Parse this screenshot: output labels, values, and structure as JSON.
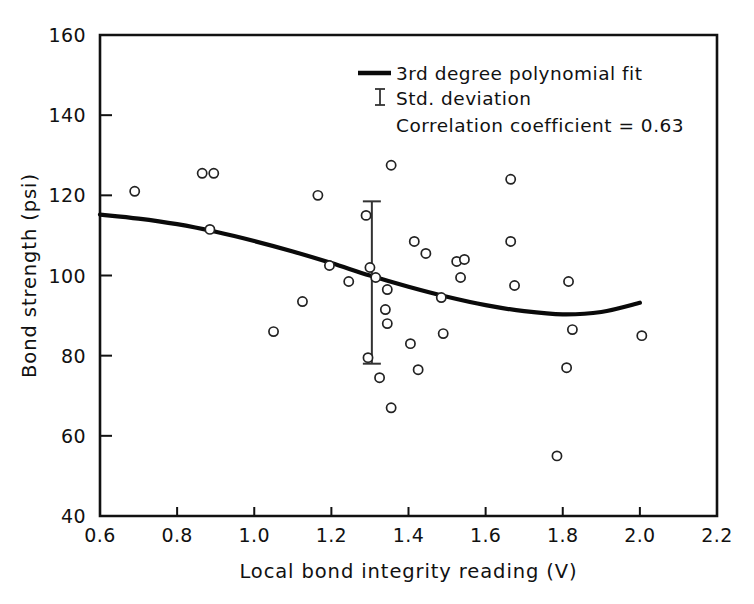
{
  "chart_data": {
    "type": "scatter",
    "title": "",
    "xlabel": "Local bond integrity reading (V)",
    "ylabel": "Bond strength (psi)",
    "xlim": [
      0.6,
      2.2
    ],
    "ylim": [
      40,
      160
    ],
    "xticks": [
      "0.6",
      "0.8",
      "1.0",
      "1.2",
      "1.4",
      "1.6",
      "1.8",
      "2.0",
      "2.2"
    ],
    "xtick_values": [
      0.6,
      0.8,
      1.0,
      1.2,
      1.4,
      1.6,
      1.8,
      2.0,
      2.2
    ],
    "yticks": [
      "40",
      "60",
      "80",
      "100",
      "120",
      "140",
      "160"
    ],
    "ytick_values": [
      40,
      60,
      80,
      100,
      120,
      140,
      160
    ],
    "grid": false,
    "legend_position": "upper-right",
    "points": [
      [
        0.69,
        121.0
      ],
      [
        0.865,
        125.5
      ],
      [
        0.895,
        125.5
      ],
      [
        0.885,
        111.5
      ],
      [
        1.05,
        86.0
      ],
      [
        1.125,
        93.5
      ],
      [
        1.165,
        120.0
      ],
      [
        1.195,
        102.5
      ],
      [
        1.245,
        98.5
      ],
      [
        1.29,
        115.0
      ],
      [
        1.3,
        102.0
      ],
      [
        1.315,
        99.5
      ],
      [
        1.295,
        79.5
      ],
      [
        1.325,
        74.5
      ],
      [
        1.355,
        127.5
      ],
      [
        1.345,
        96.5
      ],
      [
        1.34,
        91.5
      ],
      [
        1.345,
        88.0
      ],
      [
        1.355,
        67.0
      ],
      [
        1.405,
        83.0
      ],
      [
        1.415,
        108.5
      ],
      [
        1.445,
        105.5
      ],
      [
        1.425,
        76.5
      ],
      [
        1.485,
        94.5
      ],
      [
        1.49,
        85.5
      ],
      [
        1.525,
        103.5
      ],
      [
        1.545,
        104.0
      ],
      [
        1.535,
        99.5
      ],
      [
        1.665,
        124.0
      ],
      [
        1.665,
        108.5
      ],
      [
        1.675,
        97.5
      ],
      [
        1.785,
        55.0
      ],
      [
        1.815,
        98.5
      ],
      [
        1.825,
        86.5
      ],
      [
        1.81,
        77.0
      ],
      [
        2.005,
        85.0
      ]
    ],
    "fit_curve": {
      "label": "3rd degree polynomial fit",
      "x_range": [
        0.6,
        2.0
      ],
      "points": [
        [
          0.6,
          115.2
        ],
        [
          0.7,
          114.2
        ],
        [
          0.8,
          112.8
        ],
        [
          0.9,
          110.9
        ],
        [
          1.0,
          108.6
        ],
        [
          1.1,
          106.0
        ],
        [
          1.2,
          103.1
        ],
        [
          1.3,
          100.0
        ],
        [
          1.4,
          97.2
        ],
        [
          1.5,
          94.7
        ],
        [
          1.6,
          92.6
        ],
        [
          1.7,
          91.1
        ],
        [
          1.8,
          90.3
        ],
        [
          1.9,
          90.9
        ],
        [
          2.0,
          93.2
        ]
      ]
    },
    "error_bar": {
      "label": "Std. deviation",
      "x": 1.305,
      "center": 100.0,
      "upper": 118.5,
      "lower": 78.0
    },
    "annotations": [
      "Correlation coefficient = 0.63"
    ],
    "correlation_coefficient": "0.63"
  },
  "legend": {
    "fit_label": "3rd degree polynomial fit",
    "std_label": "Std. deviation",
    "corr_label": "Correlation coefficient = 0.63"
  },
  "axes": {
    "x_title": "Local bond integrity reading (V)",
    "y_title": "Bond strength (psi)",
    "x_tick_labels": [
      "0.6",
      "0.8",
      "1.0",
      "1.2",
      "1.4",
      "1.6",
      "1.8",
      "2.0",
      "2.2"
    ],
    "y_tick_labels": [
      "40",
      "60",
      "80",
      "100",
      "120",
      "140",
      "160"
    ]
  },
  "colors": {
    "ink": "#111111",
    "background": "#ffffff",
    "curve": "#0a0a0a",
    "marker_stroke": "#222222",
    "errorbar": "#333333"
  }
}
